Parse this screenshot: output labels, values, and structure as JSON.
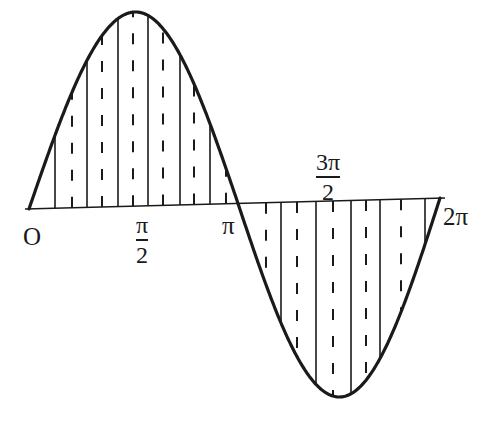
{
  "figure": {
    "colors": {
      "ink": "#1a1a1a",
      "background": "#ffffff"
    },
    "labels": {
      "origin": "O",
      "half_pi": {
        "num": "π",
        "den": "2"
      },
      "pi": "π",
      "three_half_pi": {
        "num": "3π",
        "den": "2"
      },
      "two_pi": "2π"
    },
    "geometry": {
      "axis": {
        "x1": 25,
        "y1": 209,
        "x2": 445,
        "y2": 198
      },
      "curve": {
        "start_x": 29,
        "zero_x": 238,
        "end_x": 440,
        "peak": {
          "x": 135,
          "y": 12
        },
        "trough": {
          "x": 340,
          "y": 397
        }
      },
      "solid_lines_x": [
        55,
        87,
        118,
        148,
        180,
        210,
        281,
        316,
        351,
        380,
        425
      ],
      "dashed_lines_x": [
        72,
        102,
        133,
        163,
        194,
        226,
        266,
        297,
        333,
        366,
        401
      ]
    }
  }
}
